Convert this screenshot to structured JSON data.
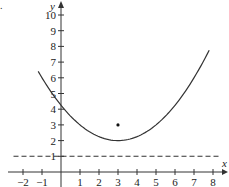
{
  "figure": {
    "corner_mark": "."
  },
  "chart_data": {
    "type": "line",
    "title": "",
    "xlabel": "x",
    "ylabel": "y",
    "xlim": [
      -2.5,
      8.6
    ],
    "ylim": [
      -0.5,
      10.7
    ],
    "x_ticks": [
      -2,
      -1,
      1,
      2,
      3,
      4,
      5,
      6,
      7,
      8
    ],
    "x_tick_labels": [
      "−2",
      "−1",
      "1",
      "2",
      "3",
      "4",
      "5",
      "6",
      "7",
      "8"
    ],
    "y_ticks": [
      1,
      2,
      3,
      4,
      5,
      6,
      7,
      8,
      9,
      10
    ],
    "y_tick_labels": [
      "1",
      "2",
      "3",
      "4",
      "5",
      "6",
      "7",
      "8",
      "9",
      "10"
    ],
    "grid": false,
    "legend": null,
    "series": [
      {
        "name": "parabola",
        "style": "solid",
        "equation": "y = (x-3)^2/4 + 2",
        "x": [
          -1.2,
          -1,
          0,
          1,
          2,
          3,
          4,
          5,
          6,
          7,
          7.8
        ],
        "y": [
          6.41,
          6.0,
          4.25,
          3.0,
          2.25,
          2.0,
          2.25,
          3.0,
          4.25,
          6.0,
          7.76
        ]
      },
      {
        "name": "directrix",
        "style": "dashed",
        "equation": "y = 1",
        "x": [
          -2.5,
          8.4
        ],
        "y": [
          1,
          1
        ]
      },
      {
        "name": "focus",
        "style": "point",
        "x": [
          3
        ],
        "y": [
          3
        ]
      }
    ],
    "annotations": [
      {
        "type": "point",
        "label": "focus",
        "x": 3,
        "y": 3
      },
      {
        "type": "vertex",
        "x": 3,
        "y": 2
      }
    ]
  }
}
